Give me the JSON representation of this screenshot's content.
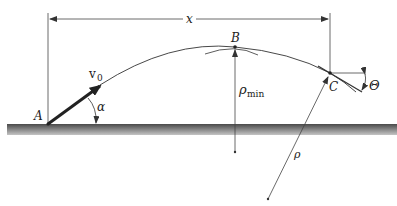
{
  "diagram": {
    "type": "projectile-trajectory",
    "labels": {
      "distance": "x",
      "velocity": "v",
      "velocity_sub": "0",
      "angle_launch": "α",
      "point_a": "A",
      "point_b": "B",
      "point_c": "C",
      "angle_c": "Θ",
      "rho_min": "ρ",
      "rho_min_sub": "min",
      "rho": "ρ"
    },
    "colors": {
      "line": "#333333",
      "ground_top": "#555555",
      "ground_bottom": "#bbbbbb",
      "background": "#ffffff"
    }
  }
}
